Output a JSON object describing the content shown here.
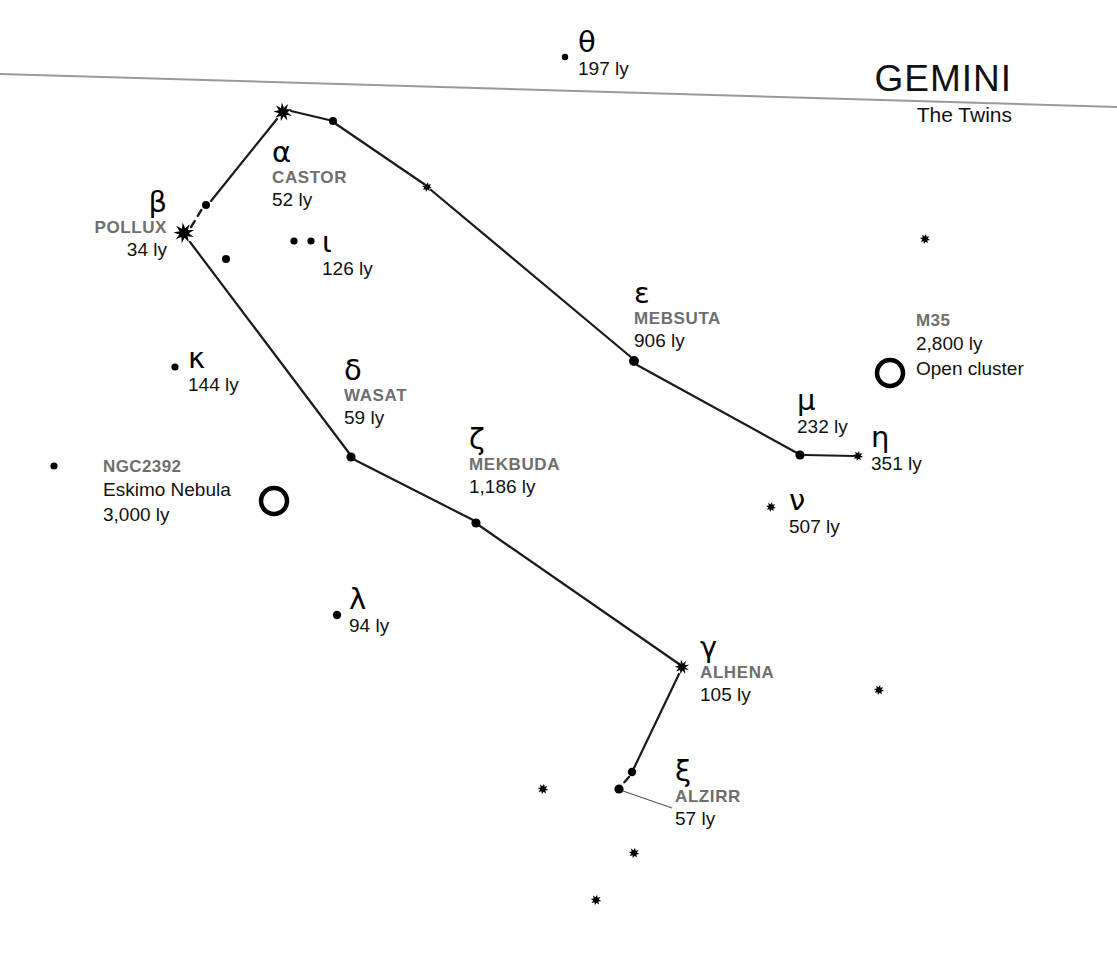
{
  "canvas": {
    "width": 1117,
    "height": 955,
    "background": "#ffffff"
  },
  "title": {
    "constellation": "GEMINI",
    "subtitle": "The Twins",
    "x": 1012,
    "y": 58,
    "sub_x": 1012,
    "sub_y": 103
  },
  "style": {
    "star_color": "#000000",
    "line_color": "#1a1a1a",
    "ecliptic_color": "#9a9a9a",
    "propername_color": "#6e6e6e",
    "text_color": "#111111"
  },
  "ecliptic": {
    "label": "ecliptic-line",
    "x1": 0,
    "y1": 74,
    "x2": 1117,
    "y2": 107,
    "width": 2.0
  },
  "stars": [
    {
      "id": "theta",
      "x": 565,
      "y": 57,
      "r": 3.2,
      "kind": "dot"
    },
    {
      "id": "castor",
      "x": 283,
      "y": 112,
      "r": 9.5,
      "kind": "burst"
    },
    {
      "id": "pollux",
      "x": 184,
      "y": 233,
      "r": 10.5,
      "kind": "burst"
    },
    {
      "id": "castor-line-dot",
      "x": 333,
      "y": 121,
      "r": 4.0,
      "kind": "dot"
    },
    {
      "id": "upsilon-node",
      "x": 427,
      "y": 187,
      "r": 5.0,
      "kind": "starlet"
    },
    {
      "id": "tau-node",
      "x": 206,
      "y": 205,
      "r": 4.0,
      "kind": "dot"
    },
    {
      "id": "rho-node",
      "x": 226,
      "y": 259,
      "r": 4.0,
      "kind": "dot"
    },
    {
      "id": "iota-a",
      "x": 294,
      "y": 241,
      "r": 3.6,
      "kind": "dot"
    },
    {
      "id": "iota-b",
      "x": 311,
      "y": 241,
      "r": 3.6,
      "kind": "dot"
    },
    {
      "id": "kappa",
      "x": 175,
      "y": 367,
      "r": 3.6,
      "kind": "dot"
    },
    {
      "id": "mebsuta",
      "x": 634,
      "y": 361,
      "r": 5.0,
      "kind": "dot"
    },
    {
      "id": "wasat",
      "x": 351,
      "y": 457,
      "r": 4.6,
      "kind": "dot"
    },
    {
      "id": "mu",
      "x": 800,
      "y": 455,
      "r": 4.6,
      "kind": "dot"
    },
    {
      "id": "eta",
      "x": 858,
      "y": 456,
      "r": 5.2,
      "kind": "starlet"
    },
    {
      "id": "mekbuda",
      "x": 476,
      "y": 523,
      "r": 4.6,
      "kind": "dot"
    },
    {
      "id": "nu",
      "x": 771,
      "y": 507,
      "r": 5.0,
      "kind": "starlet"
    },
    {
      "id": "lambda",
      "x": 337,
      "y": 615,
      "r": 4.2,
      "kind": "dot"
    },
    {
      "id": "alhena",
      "x": 682,
      "y": 667,
      "r": 7.5,
      "kind": "burst"
    },
    {
      "id": "alzirr-node",
      "x": 632,
      "y": 772,
      "r": 4.2,
      "kind": "dot"
    },
    {
      "id": "alzirr",
      "x": 619,
      "y": 789,
      "r": 4.6,
      "kind": "dot"
    },
    {
      "id": "field-left-1",
      "x": 54,
      "y": 466,
      "r": 3.6,
      "kind": "dot"
    },
    {
      "id": "field-right-1",
      "x": 925,
      "y": 239,
      "r": 5.2,
      "kind": "starlet"
    },
    {
      "id": "field-right-2",
      "x": 879,
      "y": 690,
      "r": 5.2,
      "kind": "starlet"
    },
    {
      "id": "field-bottom-1",
      "x": 543,
      "y": 789,
      "r": 5.4,
      "kind": "starlet"
    },
    {
      "id": "field-bottom-2",
      "x": 634,
      "y": 853,
      "r": 5.4,
      "kind": "starlet"
    },
    {
      "id": "field-bottom-3",
      "x": 596,
      "y": 900,
      "r": 5.4,
      "kind": "starlet"
    }
  ],
  "constellation_lines": [
    {
      "id": "pollux-castor-a",
      "x1": 191,
      "y1": 227,
      "x2": 202,
      "y2": 209,
      "dashed": true
    },
    {
      "id": "pollux-castor-b",
      "x1": 211,
      "y1": 201,
      "x2": 277,
      "y2": 119,
      "dashed": false
    },
    {
      "id": "castor-dot",
      "x1": 291,
      "y1": 111,
      "x2": 329,
      "y2": 120,
      "dashed": false
    },
    {
      "id": "dot-upsilon",
      "x1": 336,
      "y1": 124,
      "x2": 424,
      "y2": 184,
      "dashed": false
    },
    {
      "id": "upsilon-mebsuta",
      "x1": 431,
      "y1": 190,
      "x2": 632,
      "y2": 358,
      "dashed": false
    },
    {
      "id": "mebsuta-mu",
      "x1": 637,
      "y1": 365,
      "x2": 797,
      "y2": 453,
      "dashed": false
    },
    {
      "id": "mu-eta",
      "x1": 805,
      "y1": 455,
      "x2": 854,
      "y2": 456,
      "dashed": false
    },
    {
      "id": "pollux-wasat",
      "x1": 190,
      "y1": 242,
      "x2": 349,
      "y2": 453,
      "dashed": false
    },
    {
      "id": "wasat-mekbuda",
      "x1": 355,
      "y1": 460,
      "x2": 473,
      "y2": 520,
      "dashed": false
    },
    {
      "id": "mekbuda-alhena",
      "x1": 480,
      "y1": 526,
      "x2": 679,
      "y2": 664,
      "dashed": false
    },
    {
      "id": "alhena-node",
      "x1": 679,
      "y1": 674,
      "x2": 634,
      "y2": 768,
      "dashed": false
    },
    {
      "id": "node-alzirr",
      "x1": 629,
      "y1": 777,
      "x2": 621,
      "y2": 786,
      "dashed": true
    }
  ],
  "deep_sky_objects": [
    {
      "id": "m35",
      "cx": 890,
      "cy": 373,
      "r": 13,
      "stroke": 4.5
    },
    {
      "id": "ngc2392",
      "cx": 274,
      "cy": 501,
      "r": 13,
      "stroke": 4.5
    }
  ],
  "leader_lines": [
    {
      "id": "alzirr-leader",
      "x1": 623,
      "y1": 791,
      "x2": 672,
      "y2": 808
    }
  ],
  "star_labels": [
    {
      "id": "theta",
      "greek": "θ",
      "propername": "",
      "distance": "197 ly",
      "x": 578,
      "y": 28,
      "align": "left"
    },
    {
      "id": "castor",
      "greek": "α",
      "propername": "CASTOR",
      "distance": "52 ly",
      "x": 272,
      "y": 138,
      "align": "left"
    },
    {
      "id": "pollux",
      "greek": "β",
      "propername": "POLLUX",
      "distance": "34 ly",
      "x": 167,
      "y": 188,
      "align": "right"
    },
    {
      "id": "iota",
      "greek": "ι",
      "propername": "",
      "distance": "126 ly",
      "x": 322,
      "y": 228,
      "align": "left"
    },
    {
      "id": "kappa",
      "greek": "κ",
      "propername": "",
      "distance": "144 ly",
      "x": 188,
      "y": 344,
      "align": "left"
    },
    {
      "id": "mebsuta",
      "greek": "ε",
      "propername": "MEBSUTA",
      "distance": "906 ly",
      "x": 634,
      "y": 279,
      "align": "left"
    },
    {
      "id": "wasat",
      "greek": "δ",
      "propername": "WASAT",
      "distance": "59 ly",
      "x": 344,
      "y": 356,
      "align": "left"
    },
    {
      "id": "mekbuda",
      "greek": "ζ",
      "propername": "MEKBUDA",
      "distance": "1,186 ly",
      "x": 469,
      "y": 425,
      "align": "left"
    },
    {
      "id": "mu",
      "greek": "μ",
      "propername": "",
      "distance": "232 ly",
      "x": 797,
      "y": 386,
      "align": "left"
    },
    {
      "id": "eta",
      "greek": "η",
      "propername": "",
      "distance": "351 ly",
      "x": 871,
      "y": 423,
      "align": "left"
    },
    {
      "id": "nu",
      "greek": "ν",
      "propername": "",
      "distance": "507 ly",
      "x": 789,
      "y": 486,
      "align": "left"
    },
    {
      "id": "lambda",
      "greek": "λ",
      "propername": "",
      "distance": "94 ly",
      "x": 349,
      "y": 585,
      "align": "left"
    },
    {
      "id": "alhena",
      "greek": "γ",
      "propername": "ALHENA",
      "distance": "105 ly",
      "x": 700,
      "y": 633,
      "align": "left"
    },
    {
      "id": "alzirr",
      "greek": "ξ",
      "propername": "ALZIRR",
      "distance": "57 ly",
      "x": 675,
      "y": 757,
      "align": "left"
    }
  ],
  "dso_labels": [
    {
      "id": "m35",
      "name": "M35",
      "lines": [
        "2,800 ly",
        "Open cluster"
      ],
      "x": 916,
      "y": 310,
      "align": "left"
    },
    {
      "id": "ngc2392",
      "name": "NGC2392",
      "lines": [
        "Eskimo Nebula",
        "3,000 ly"
      ],
      "x": 103,
      "y": 456,
      "align": "left"
    }
  ]
}
